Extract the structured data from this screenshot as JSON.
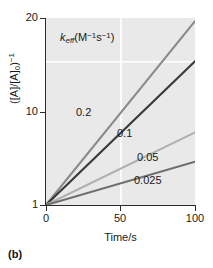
{
  "figure": {
    "panel_caption": "(b)",
    "units_annotation_plain": "keff(M-1s-1)",
    "units_annotation": {
      "symbol": "k",
      "subscript": "eff",
      "open": "(M",
      "exp1": "−1",
      "mid": "s",
      "exp2": "−1",
      "close": ")"
    },
    "y_axis_title_plain": "([A]/[A]0)-1",
    "y_axis_title": {
      "open": "([A]/[A]",
      "sub": "0",
      "close": ")",
      "exp": "−1"
    },
    "background_color": "#ffffff",
    "plot_background_color": "#e9e9e9",
    "gridline_color": "#ffffff",
    "axis_color": "#2b2b2b"
  },
  "chart_data": {
    "type": "line",
    "title": "",
    "subtitle": "",
    "xlabel": "Time/s",
    "ylabel": "([A]/[A]₀)⁻¹",
    "xlim": [
      0,
      100
    ],
    "ylim": [
      1,
      20
    ],
    "yscale": "log",
    "xscale": "linear",
    "grid": true,
    "gridlines_x": [
      50
    ],
    "gridlines_y": [
      10
    ],
    "xticks": [
      0,
      50,
      100
    ],
    "xticklabels": [
      "0",
      "50",
      "100"
    ],
    "yticks": [
      1,
      10,
      20
    ],
    "yticklabels": [
      "1",
      "10",
      "20"
    ],
    "legend_position": "inline-labels",
    "legend_title": "k_eff (M⁻¹s⁻¹)",
    "x": [
      0,
      100
    ],
    "series": [
      {
        "name": "0.2",
        "label": "0.2",
        "k_eff": 0.2,
        "values": [
          1,
          19.0
        ],
        "color": "#8a8a8a",
        "label_x": 27,
        "label_y": 8.5
      },
      {
        "name": "0.1",
        "label": "0.1",
        "k_eff": 0.1,
        "values": [
          1,
          10.0
        ],
        "color": "#3a3a3a",
        "label_x": 52,
        "label_y": 6.2
      },
      {
        "name": "0.05",
        "label": "0.05",
        "k_eff": 0.05,
        "values": [
          1,
          3.2
        ],
        "color": "#b0b0b0",
        "label_x": 68,
        "label_y": 3.6
      },
      {
        "name": "0.025",
        "label": "0.025",
        "k_eff": 0.025,
        "values": [
          1,
          2.0
        ],
        "color": "#6e6e6e",
        "label_x": 66,
        "label_y": 2.25
      }
    ]
  }
}
